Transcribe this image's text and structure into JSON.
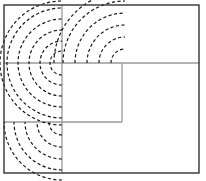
{
  "figure": {
    "canvas": {
      "width": 206,
      "height": 181
    },
    "colors": {
      "background": "#ffffff",
      "frame_stroke": "#333333",
      "construction_stroke": "#9a9a9a",
      "arc_stroke": "#1a1a1a"
    },
    "strokes": {
      "frame_width": 1.4,
      "construction_width": 1.3,
      "arc_width": 1.2,
      "arc_dash": "3.2 2.4"
    }
  },
  "chart_data": {
    "type": "diagram",
    "xlabel": "",
    "ylabel": "",
    "xlim": [
      0,
      206
    ],
    "ylim": [
      0,
      181
    ],
    "grid": false,
    "legend": "none",
    "frame": {
      "x": 4,
      "y": 5,
      "width": 195,
      "height": 168
    },
    "construction_lines": [
      {
        "name": "vertical-left",
        "x1": 62,
        "y1": 5,
        "x2": 62,
        "y2": 173
      },
      {
        "name": "horizontal-upper",
        "x1": 4,
        "y1": 63,
        "x2": 199,
        "y2": 63
      },
      {
        "name": "horizontal-lower",
        "x1": 4,
        "y1": 122,
        "x2": 122,
        "y2": 122
      },
      {
        "name": "vertical-right",
        "x1": 122,
        "y1": 63,
        "x2": 122,
        "y2": 122
      }
    ],
    "arc_families": [
      {
        "name": "top-left-fan",
        "center": [
          62,
          63
        ],
        "start_angle_deg": 90,
        "end_angle_deg": 270,
        "sweep_description": "quarter-to-half arcs opening up and left from center",
        "radii": [
          12,
          22,
          33,
          44,
          55,
          62
        ]
      },
      {
        "name": "top-right-fan",
        "center": [
          125,
          63
        ],
        "start_angle_deg": 180,
        "end_angle_deg": 270,
        "sweep_description": "quarter arcs opening up and right from center",
        "radii": [
          14,
          26,
          38,
          50,
          62,
          71
        ]
      },
      {
        "name": "bottom-left-fan",
        "center": [
          62,
          122
        ],
        "start_angle_deg": 90,
        "end_angle_deg": 180,
        "sweep_description": "quarter arcs opening down and left from center",
        "radii": [
          13,
          25,
          37,
          48,
          58
        ]
      }
    ]
  }
}
